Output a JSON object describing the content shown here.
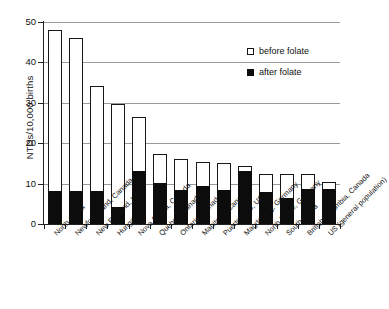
{
  "chart_data": {
    "type": "bar",
    "stacked": false,
    "title": "",
    "xlabel": "",
    "ylabel": "NTDs/10,000 births",
    "ylim": [
      0,
      50
    ],
    "yticks": [
      0,
      10,
      20,
      30,
      40,
      50
    ],
    "ytick_labels": [
      "0",
      "10",
      "20",
      "30",
      "40",
      "50"
    ],
    "grid": true,
    "grid_axis": "y",
    "legend_position": "upper right",
    "categories": [
      "North China",
      "Newfoundland, Canada",
      "New England, US",
      "Hungary",
      "Nova Scotia, Canada",
      "Quebec, Canada",
      "Ontario, Canada",
      "Manitoba, Canada",
      "Puerto Rico, US",
      "Magdeburg, Germany",
      "North Rhine, Germany",
      "South China",
      "British Columbia, Canada",
      "US (general population)"
    ],
    "series": [
      {
        "name": "before folate",
        "color": "#ffffff",
        "edgecolor": "#181818",
        "values": [
          48.0,
          46.0,
          34.1,
          29.8,
          26.5,
          17.3,
          16.2,
          15.3,
          15.2,
          14.3,
          12.3,
          12.3,
          12.3,
          10.4
        ]
      },
      {
        "name": "after folate",
        "color": "#0c0c0c",
        "edgecolor": "#0c0c0c",
        "values": [
          8.1,
          8.1,
          8.1,
          4.3,
          13.0,
          10.2,
          8.4,
          9.4,
          8.4,
          13.2,
          8.0,
          6.5,
          8.6,
          8.6
        ]
      }
    ]
  },
  "legend": {
    "items": [
      {
        "label": "before folate",
        "swatch": "open-square-icon"
      },
      {
        "label": "after folate",
        "swatch": "filled-square-icon"
      }
    ]
  },
  "axes": {
    "y_title": "NTDs/10,000 births"
  }
}
